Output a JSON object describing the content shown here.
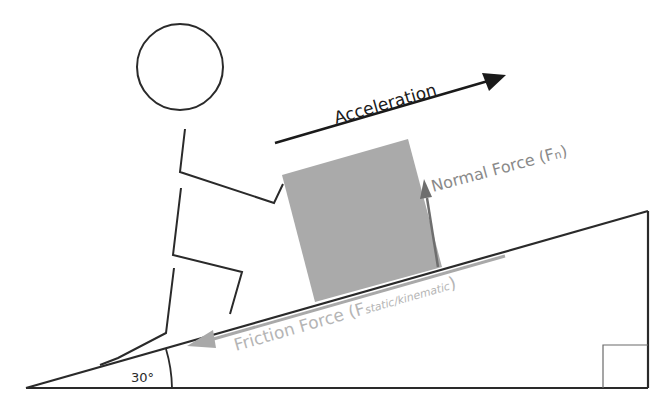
{
  "diagram": {
    "labels": {
      "acceleration": "Acceleration",
      "normal_force": "Normal Force (F",
      "normal_force_sub": "n",
      "normal_force_close": ")",
      "friction_force": "Friction Force (F",
      "friction_force_sub": "static/kinematic",
      "friction_force_close": ")",
      "angle": "30°"
    },
    "colors": {
      "line": "#2a2a2a",
      "box": "#aaaaaa",
      "force_gray": "#999999",
      "friction_text": "#b5b5b5",
      "normal_text": "#8a8a8a",
      "arrow_dark": "#1a1a1a"
    }
  }
}
